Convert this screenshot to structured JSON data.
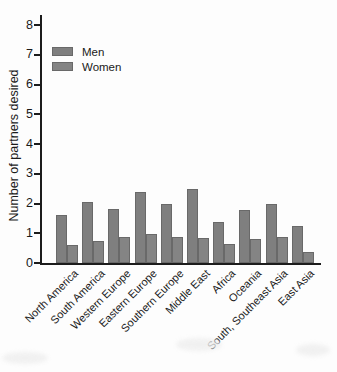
{
  "figure": {
    "background": "#fdfdfd",
    "axis_color": "#1c1c1c",
    "text_color": "#1a1a1a",
    "men_color": "#7f7f7f",
    "women_color": "#848484",
    "bar_border_color": "#696969"
  },
  "chart_data": {
    "type": "bar",
    "title": "",
    "xlabel": "",
    "ylabel": "Number of partners desired",
    "ylim": [
      0,
      8
    ],
    "yticks": [
      0,
      1,
      2,
      3,
      4,
      5,
      6,
      7,
      8
    ],
    "grid": false,
    "legend_position": "upper-left inside plot",
    "categories": [
      "North America",
      "South America",
      "Western Europe",
      "Eastern Europe",
      "Southern Europe",
      "Middle East",
      "Africa",
      "Oceania",
      "South, Southeast Asia",
      "East Asia"
    ],
    "series": [
      {
        "name": "Men",
        "values": [
          1.62,
          2.05,
          1.8,
          2.4,
          2.0,
          2.5,
          1.37,
          1.77,
          2.0,
          1.25
        ]
      },
      {
        "name": "Women",
        "values": [
          0.6,
          0.75,
          0.87,
          0.98,
          0.87,
          0.84,
          0.65,
          0.8,
          0.87,
          0.38
        ]
      }
    ]
  }
}
